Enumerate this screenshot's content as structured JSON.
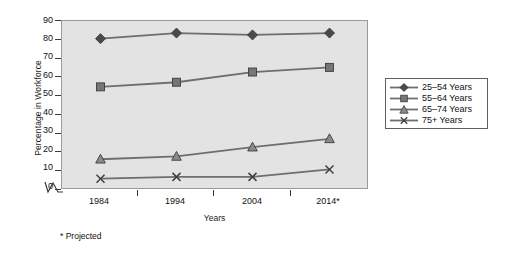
{
  "chart_data": {
    "type": "line",
    "title": "",
    "xlabel": "Years",
    "ylabel": "Percentage in Workforce",
    "categories": [
      "1984",
      "1994",
      "2004",
      "2014*"
    ],
    "x": [
      1984,
      1994,
      2004,
      2014
    ],
    "xlim": [
      1979,
      2019
    ],
    "ylim": [
      0,
      90
    ],
    "ytick_labels": [
      "0",
      "10",
      "20",
      "30",
      "40",
      "50",
      "60",
      "70",
      "80",
      "90"
    ],
    "yticks": [
      0,
      10,
      20,
      30,
      40,
      50,
      60,
      70,
      80,
      90
    ],
    "grid": false,
    "legend_position": "right",
    "y_axis_break": true,
    "footnote": "* Projected",
    "series": [
      {
        "name": "25–54 Years",
        "marker": "diamond",
        "values": [
          80.5,
          83.5,
          82.5,
          83.5
        ]
      },
      {
        "name": "55–64 Years",
        "marker": "square",
        "values": [
          54.5,
          57.0,
          62.5,
          65.0
        ]
      },
      {
        "name": "65–74 Years",
        "marker": "triangle",
        "values": [
          15.5,
          17.0,
          22.0,
          26.5
        ]
      },
      {
        "name": "75+ Years",
        "marker": "cross",
        "values": [
          5.0,
          6.0,
          6.0,
          10.0
        ]
      }
    ],
    "colors": {
      "plot_background": "#e3e3e3",
      "plot_border": "#9a9a9a",
      "line": "#6e6e6e",
      "marker_fill": "#595959",
      "marker_edge": "#3c3c3c",
      "text": "#111111",
      "page_background": "#ffffff"
    }
  },
  "legend": {
    "items": [
      {
        "label": "25–54 Years",
        "marker": "diamond-marker"
      },
      {
        "label": "55–64 Years",
        "marker": "square-marker"
      },
      {
        "label": "65–74 Years",
        "marker": "triangle-marker"
      },
      {
        "label": "75+ Years",
        "marker": "cross-marker"
      }
    ]
  },
  "axes": {
    "y_title": "Percentage in Workforce",
    "x_title": "Years",
    "y_labels": [
      "90",
      "80",
      "70",
      "60",
      "50",
      "40",
      "30",
      "20",
      "10",
      "0"
    ],
    "x_labels": [
      "1984",
      "1994",
      "2004",
      "2014*"
    ]
  },
  "notes": {
    "footnote": "* Projected"
  }
}
